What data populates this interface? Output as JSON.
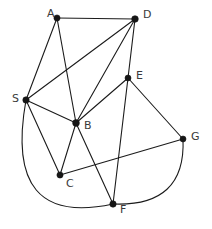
{
  "diagram": {
    "type": "node-link-graph",
    "background_color": "#ffffff",
    "edge_color": "#1b1b1b",
    "node_color": "#161616",
    "label_color": "#3a3a3a",
    "width": 212,
    "height": 229,
    "nodes": [
      {
        "id": "A",
        "label": "A",
        "x": 57,
        "y": 18,
        "r": 3.1,
        "label_x": 47,
        "label_y": 17
      },
      {
        "id": "D",
        "label": "D",
        "x": 135,
        "y": 19,
        "r": 3.3,
        "label_x": 143,
        "label_y": 18
      },
      {
        "id": "E",
        "label": "E",
        "x": 128,
        "y": 78,
        "r": 3.0,
        "label_x": 136,
        "label_y": 79
      },
      {
        "id": "S",
        "label": "S",
        "x": 26,
        "y": 100,
        "r": 3.2,
        "label_x": 12,
        "label_y": 102
      },
      {
        "id": "B",
        "label": "B",
        "x": 76,
        "y": 123,
        "r": 3.4,
        "label_x": 84,
        "label_y": 129
      },
      {
        "id": "G",
        "label": "G",
        "x": 183,
        "y": 139,
        "r": 3.0,
        "label_x": 191,
        "label_y": 140
      },
      {
        "id": "C",
        "label": "C",
        "x": 60,
        "y": 175,
        "r": 3.1,
        "label_x": 66,
        "label_y": 187
      },
      {
        "id": "F",
        "label": "F",
        "x": 113,
        "y": 204,
        "r": 3.2,
        "label_x": 120,
        "label_y": 213
      }
    ],
    "edges": [
      {
        "id": "A-D",
        "from": "A",
        "to": "D",
        "shape": "line"
      },
      {
        "id": "A-S",
        "from": "A",
        "to": "S",
        "shape": "line"
      },
      {
        "id": "A-B",
        "from": "A",
        "to": "B",
        "shape": "line"
      },
      {
        "id": "D-S",
        "from": "D",
        "to": "S",
        "shape": "line"
      },
      {
        "id": "D-B",
        "from": "D",
        "to": "B",
        "shape": "line"
      },
      {
        "id": "D-E",
        "from": "D",
        "to": "E",
        "shape": "line"
      },
      {
        "id": "S-B",
        "from": "S",
        "to": "B",
        "shape": "line"
      },
      {
        "id": "S-C",
        "from": "S",
        "to": "C",
        "shape": "line"
      },
      {
        "id": "E-B",
        "from": "E",
        "to": "B",
        "shape": "line"
      },
      {
        "id": "E-G",
        "from": "E",
        "to": "G",
        "shape": "line"
      },
      {
        "id": "E-F",
        "from": "E",
        "to": "F",
        "shape": "line"
      },
      {
        "id": "B-C",
        "from": "B",
        "to": "C",
        "shape": "line"
      },
      {
        "id": "B-F",
        "from": "B",
        "to": "F",
        "shape": "line"
      },
      {
        "id": "C-G",
        "from": "C",
        "to": "G",
        "shape": "line"
      },
      {
        "id": "S-F",
        "from": "S",
        "to": "F",
        "shape": "curve",
        "cx": 3,
        "cy": 228
      },
      {
        "id": "G-F",
        "from": "G",
        "to": "F",
        "shape": "curve",
        "cx": 186,
        "cy": 207
      }
    ]
  }
}
